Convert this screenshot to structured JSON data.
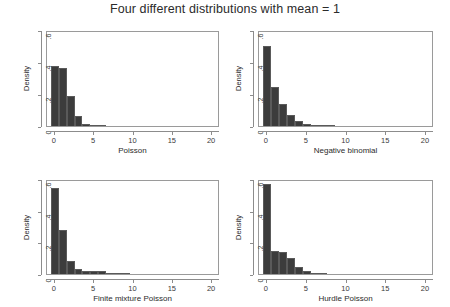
{
  "figure": {
    "title": "Four different distributions with mean = 1",
    "width": 450,
    "height": 307
  },
  "chart_data": [
    {
      "type": "bar",
      "title": "Poisson",
      "xlabel": "Poisson",
      "ylabel": "Density",
      "xlim": [
        -1,
        21
      ],
      "ylim": [
        0,
        0.6
      ],
      "xticks": [
        "0",
        "5",
        "10",
        "15",
        "20"
      ],
      "xtick_values": [
        0,
        5,
        10,
        15,
        20
      ],
      "yticks": [
        "0",
        ".2",
        ".4",
        ".6"
      ],
      "ytick_values": [
        0,
        0.2,
        0.4,
        0.6
      ],
      "grid": false,
      "legend": "none",
      "bin_width": 1,
      "x": [
        0,
        1,
        2,
        3,
        4,
        5,
        6
      ],
      "values": [
        0.372,
        0.362,
        0.19,
        0.062,
        0.013,
        0.004,
        0.001
      ]
    },
    {
      "type": "bar",
      "title": "Negative binomial",
      "xlabel": "Negative binomial",
      "ylabel": "Density",
      "xlim": [
        -1,
        21
      ],
      "ylim": [
        0,
        0.6
      ],
      "xticks": [
        "0",
        "5",
        "10",
        "15",
        "20"
      ],
      "xtick_values": [
        0,
        5,
        10,
        15,
        20
      ],
      "yticks": [
        "0",
        ".2",
        ".4",
        ".6"
      ],
      "ytick_values": [
        0,
        0.2,
        0.4,
        0.6
      ],
      "grid": false,
      "legend": "none",
      "bin_width": 1,
      "x": [
        0,
        1,
        2,
        3,
        4,
        5,
        6,
        7,
        8
      ],
      "values": [
        0.502,
        0.246,
        0.135,
        0.067,
        0.031,
        0.015,
        0.008,
        0.004,
        0.002
      ]
    },
    {
      "type": "bar",
      "title": "Finite mixture Poisson",
      "xlabel": "Finite mixture Poisson",
      "ylabel": "Density",
      "xlim": [
        -1,
        21
      ],
      "ylim": [
        0,
        0.6
      ],
      "xticks": [
        "0",
        "5",
        "10",
        "15",
        "20"
      ],
      "xtick_values": [
        0,
        5,
        10,
        15,
        20
      ],
      "yticks": [
        "0",
        ".2",
        ".4",
        ".6"
      ],
      "ytick_values": [
        0,
        0.2,
        0.4,
        0.6
      ],
      "grid": false,
      "legend": "none",
      "bin_width": 1,
      "x": [
        0,
        1,
        2,
        3,
        4,
        5,
        6,
        7,
        8,
        9
      ],
      "values": [
        0.541,
        0.277,
        0.081,
        0.029,
        0.022,
        0.019,
        0.016,
        0.009,
        0.004,
        0.002
      ]
    },
    {
      "type": "bar",
      "title": "Hurdle Poisson",
      "xlabel": "Hurdle Poisson",
      "ylabel": "Density",
      "xlim": [
        -1,
        21
      ],
      "ylim": [
        0,
        0.6
      ],
      "xticks": [
        "0",
        "5",
        "10",
        "15",
        "20"
      ],
      "xtick_values": [
        0,
        5,
        10,
        15,
        20
      ],
      "yticks": [
        "0",
        ".2",
        ".4",
        ".6"
      ],
      "ytick_values": [
        0,
        0.2,
        0.4,
        0.6
      ],
      "grid": false,
      "legend": "none",
      "bin_width": 1,
      "x": [
        0,
        1,
        2,
        3,
        4,
        5,
        6,
        7
      ],
      "values": [
        0.571,
        0.146,
        0.142,
        0.102,
        0.046,
        0.019,
        0.007,
        0.002
      ]
    }
  ],
  "colors": {
    "bar_fill": "#3c3c3c",
    "bar_edge": "#5a5a5a",
    "axis": "#8c8c8c",
    "box": "#9a9a9a",
    "text": "#2b2b2b",
    "background": "#ffffff"
  }
}
